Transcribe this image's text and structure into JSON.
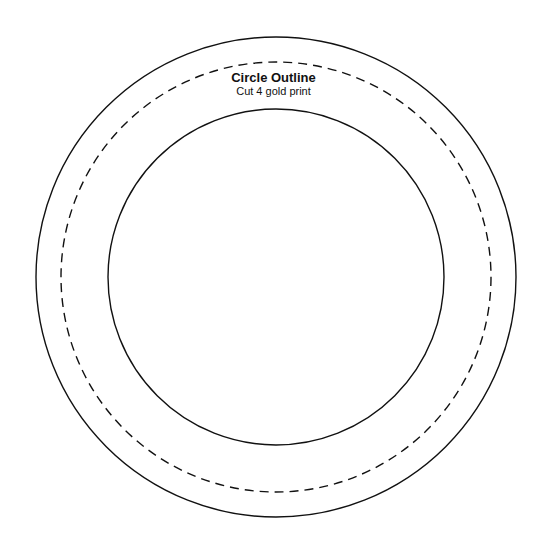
{
  "pattern": {
    "title": "Circle Outline",
    "subtitle": "Cut 4 gold print"
  },
  "circles": {
    "center": [
      276,
      277
    ],
    "outer": {
      "radius": 240,
      "style": "solid",
      "color": "#111111"
    },
    "seam": {
      "radius": 215,
      "style": "dashed",
      "color": "#111111"
    },
    "inner": {
      "radius": 168,
      "style": "solid",
      "color": "#111111"
    }
  }
}
